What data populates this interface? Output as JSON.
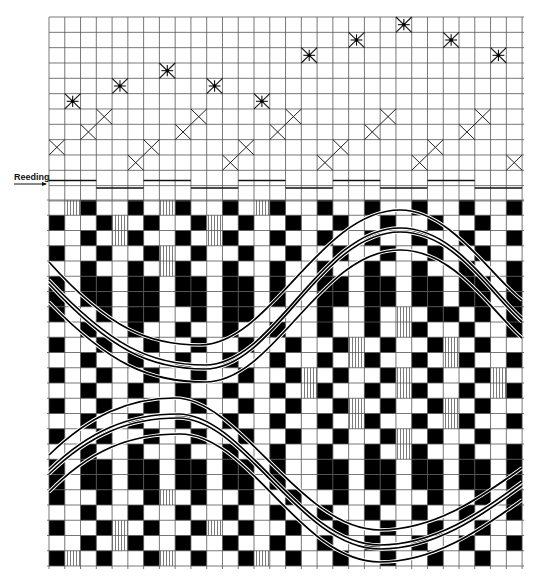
{
  "diagram": {
    "type": "weaving-draft",
    "grid": {
      "origin_x": 49,
      "origin_y": 17,
      "columns": 30,
      "col_width": 15.77,
      "threading_rows": 12,
      "threading_row_height": 15.33,
      "drawdown_top": 200,
      "drawdown_rows": 24,
      "drawdown_row_height": 15.25
    },
    "colors": {
      "line": "#555555",
      "ink": "#000000",
      "paper": "#ffffff"
    },
    "reeding": {
      "label": "Reeding",
      "groups": [
        {
          "cols": [
            0,
            2
          ],
          "level": "upper"
        },
        {
          "cols": [
            3,
            5
          ],
          "level": "lower"
        },
        {
          "cols": [
            6,
            8
          ],
          "level": "upper"
        },
        {
          "cols": [
            9,
            11
          ],
          "level": "lower"
        },
        {
          "cols": [
            12,
            14
          ],
          "level": "upper"
        },
        {
          "cols": [
            15,
            17
          ],
          "level": "lower"
        },
        {
          "cols": [
            18,
            20
          ],
          "level": "upper"
        },
        {
          "cols": [
            21,
            23
          ],
          "level": "lower"
        },
        {
          "cols": [
            24,
            26
          ],
          "level": "upper"
        },
        {
          "cols": [
            27,
            29
          ],
          "level": "lower"
        }
      ]
    },
    "threading": {
      "x_marks": [
        {
          "col": 0,
          "row": 8
        },
        {
          "col": 2,
          "row": 7
        },
        {
          "col": 3,
          "row": 6
        },
        {
          "col": 5,
          "row": 9
        },
        {
          "col": 6,
          "row": 8
        },
        {
          "col": 8,
          "row": 7
        },
        {
          "col": 9,
          "row": 6
        },
        {
          "col": 11,
          "row": 9
        },
        {
          "col": 12,
          "row": 8
        },
        {
          "col": 14,
          "row": 7
        },
        {
          "col": 15,
          "row": 6
        },
        {
          "col": 17,
          "row": 9
        },
        {
          "col": 18,
          "row": 8
        },
        {
          "col": 20,
          "row": 7
        },
        {
          "col": 21,
          "row": 6
        },
        {
          "col": 23,
          "row": 9
        },
        {
          "col": 24,
          "row": 8
        },
        {
          "col": 26,
          "row": 7
        },
        {
          "col": 27,
          "row": 6
        },
        {
          "col": 29,
          "row": 9
        }
      ],
      "star_marks": [
        {
          "col": 1,
          "row": 5
        },
        {
          "col": 4,
          "row": 4
        },
        {
          "col": 7,
          "row": 3
        },
        {
          "col": 10,
          "row": 4
        },
        {
          "col": 13,
          "row": 5
        },
        {
          "col": 16,
          "row": 2
        },
        {
          "col": 19,
          "row": 1
        },
        {
          "col": 22,
          "row": 0
        },
        {
          "col": 25,
          "row": 1
        },
        {
          "col": 28,
          "row": 2
        }
      ]
    },
    "drawdown": {
      "legend": {
        "B": "black",
        "W": "white",
        "V": "vertical-hatch"
      },
      "rows": [
        "WVBWWBWVBWWBWVBWWBWWBWWBWWBWWB",
        "BWWBVWBWWBVWBWWBWWBWWBWWBWWBWW",
        "WWBWVBWWBWVBWWBWWBWWBWWBWWBWWB",
        "BWWBWWBVWBWWBWWBWWBWWBWWBWWBWW",
        "WWBWWBWVBWWBWWBWWBWWBWWBWWBWWB",
        "BWBBWBBWBBWBBWBWWBBWBBWBBWBBWB",
        "BWBBWBBWBBWBBWBWWBBWBBWBBWBBWB",
        "BWWBWBBWWBWBBWWWWBWWBWVWBBWBWB",
        "WWBWWBWWBWWBWWBWWBWWBWVBWWBWWB",
        "BWWBWWBWWBWWBWWBWWBVWBWWBVWBWW",
        "WWBWWBWWBWWBWWBWWBWVBWWBWVBWWB",
        "BWWBWWBWWBWWBWWBVWBWWBVWBWWBVW",
        "WWBWWBWWBWWBWWBWVBWWBWVBWWBWVB",
        "BWWBWWBWWBWWBWWBWWBVWBWWBVWBWW",
        "WWBWWBWWBWWBWWBWWBWVBWWBWVBWWB",
        "BWWBWWBWWBWWBWWBWWBWWBVWBWWBWW",
        "WWBWWBWWBWWBWWBWWBWWBWVBWWBWWB",
        "BWBBWBBWBBWBBWBWWBBWBBWBBWBBWB",
        "BWBBWBBWBBWBBWBWWBBWBBWBBWBBWB",
        "BWWBWWBVWBWWBWWBWWBWWBWWBWWBWB",
        "WWBWWBWWBWWBWWBWWBWWBWWBWWBWWB",
        "BWWBVWBWWBVWBWWBWWBWWBWWBWWBWW",
        "WWBWVBWWBWWBWWBWWBWWBWWBWWBWWB",
        "BVWBWWBVWBWWBVWBWWBWWBWWBWWBWW"
      ]
    },
    "curves": [
      {
        "name": "upper-wave-outer",
        "d": "M49,262 C110,330 150,345 200,345 C270,345 320,210 400,210 C450,210 490,275 522,300"
      },
      {
        "name": "upper-wave-mid-a",
        "d": "M49,280 C110,345 150,365 205,365 C275,365 320,228 400,228 C455,228 490,290 522,318"
      },
      {
        "name": "upper-wave-mid-b",
        "d": "M49,284 C110,350 150,369 205,369 C275,369 320,232 400,232 C455,232 490,294 522,322"
      },
      {
        "name": "upper-wave-inner",
        "d": "M49,302 C110,365 150,382 205,382 C275,382 320,250 400,250 C455,250 490,310 522,338"
      },
      {
        "name": "lower-wave-outer",
        "d": "M49,455 C90,415 130,398 175,398 C240,398 300,530 380,530 C440,530 490,490 522,468"
      },
      {
        "name": "lower-wave-mid-a",
        "d": "M49,470 C90,430 130,414 178,414 C245,414 300,545 380,545 C440,545 490,505 522,482"
      },
      {
        "name": "lower-wave-mid-b",
        "d": "M49,474 C90,434 130,418 178,418 C245,418 300,549 380,549 C440,549 490,509 522,486"
      },
      {
        "name": "lower-wave-inner",
        "d": "M49,492 C90,450 130,434 180,434 C250,434 300,562 380,562 C440,562 490,522 522,500"
      }
    ]
  }
}
